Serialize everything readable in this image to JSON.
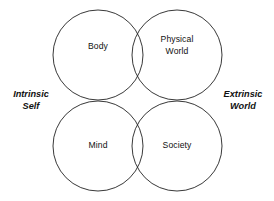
{
  "diagram": {
    "type": "venn",
    "background_color": "#ffffff",
    "stroke_color": "#222222",
    "circles": [
      {
        "id": "body",
        "label": "Body",
        "cx": 98,
        "cy": 55,
        "r": 45
      },
      {
        "id": "physical",
        "label": "Physical\nWorld",
        "cx": 177,
        "cy": 55,
        "r": 45
      },
      {
        "id": "mind",
        "label": "Mind",
        "cx": 98,
        "cy": 146,
        "r": 45
      },
      {
        "id": "society",
        "label": "Society",
        "cx": 177,
        "cy": 146,
        "r": 45
      }
    ],
    "region_labels": {
      "top_left": "Body",
      "top_right": "Physical\nWorld",
      "bottom_left": "Mind",
      "bottom_right": "Society"
    },
    "axis_labels": {
      "left": "Intrinsic\nSelf",
      "right": "Extrinsic\nWorld"
    }
  }
}
